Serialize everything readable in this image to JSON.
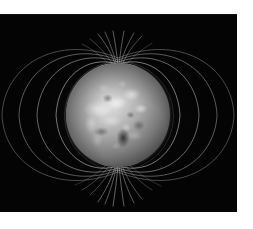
{
  "figure": {
    "name": "planetary-magnetic-field",
    "background_color": "#ffffff",
    "plate_color": "#040404",
    "field_line_color": "#c8c8c8",
    "plate": {
      "x": 0,
      "y": 14,
      "width": 237,
      "height": 198
    }
  },
  "planet": {
    "label": "planet",
    "center_x": 118,
    "center_y": 101,
    "radius": 52,
    "surface_tone_light": "#e9e9e9",
    "surface_tone_mid": "#a8a8a8",
    "surface_tone_dark": "#1d1d1d"
  },
  "chart_data": {
    "type": "line",
    "subtitle": "",
    "xlabel": "",
    "ylabel": "",
    "grid": false,
    "legend": "none",
    "xlim": [
      0,
      237
    ],
    "ylim": [
      0,
      198
    ],
    "poles": [
      {
        "name": "north-magnetic-pole",
        "x": 118,
        "y": 51
      },
      {
        "name": "south-magnetic-pole",
        "x": 118,
        "y": 151
      }
    ],
    "series": [
      {
        "name": "field-line-1-left",
        "side": "left",
        "apex_x": 74,
        "shell": 1
      },
      {
        "name": "field-line-2-left",
        "side": "left",
        "apex_x": 58,
        "shell": 2
      },
      {
        "name": "field-line-3-left",
        "side": "left",
        "apex_x": 40,
        "shell": 3
      },
      {
        "name": "field-line-4-left",
        "side": "left",
        "apex_x": 22,
        "shell": 4
      },
      {
        "name": "field-line-5-left",
        "side": "left",
        "apex_x": 6,
        "shell": 5
      },
      {
        "name": "field-line-1-right",
        "side": "right",
        "apex_x": 162,
        "shell": 1
      },
      {
        "name": "field-line-2-right",
        "side": "right",
        "apex_x": 178,
        "shell": 2
      },
      {
        "name": "field-line-3-right",
        "side": "right",
        "apex_x": 196,
        "shell": 3
      },
      {
        "name": "field-line-4-right",
        "side": "right",
        "apex_x": 214,
        "shell": 4
      },
      {
        "name": "field-line-5-right",
        "side": "right",
        "apex_x": 230,
        "shell": 5
      }
    ],
    "polar_fan_count": 14
  }
}
